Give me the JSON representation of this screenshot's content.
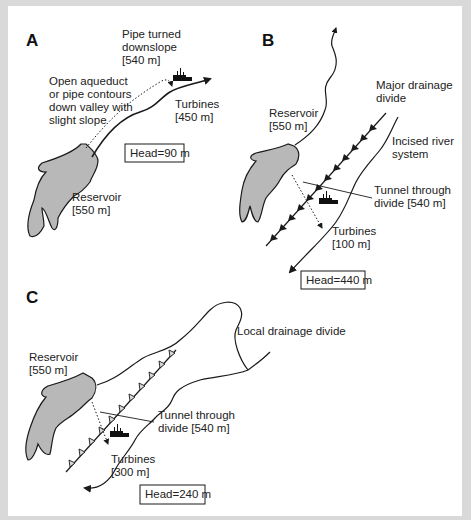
{
  "figure": {
    "panels": [
      {
        "id": "A",
        "label": "A",
        "labels": {
          "pipe_turned_line1": "Pipe turned",
          "pipe_turned_line2": "downslope",
          "pipe_turned_line3": "[540 m]",
          "aqueduct_line1": "Open aqueduct",
          "aqueduct_line2": "or pipe contours",
          "aqueduct_line3": "down valley with",
          "aqueduct_line4": "slight slope",
          "turbines_line1": "Turbines",
          "turbines_line2": "[450 m]",
          "reservoir_line1": "Reservoir",
          "reservoir_line2": "[550 m]"
        },
        "head": "Head=90 m"
      },
      {
        "id": "B",
        "label": "B",
        "labels": {
          "divide_line1": "Major drainage",
          "divide_line2": "divide",
          "reservoir_line1": "Reservoir",
          "reservoir_line2": "[550 m]",
          "river_line1": "Incised river",
          "river_line2": "system",
          "tunnel_line1": "Tunnel through",
          "tunnel_line2": "divide [540 m]",
          "turbines_line1": "Turbines",
          "turbines_line2": "[100 m]"
        },
        "head": "Head=440 m"
      },
      {
        "id": "C",
        "label": "C",
        "labels": {
          "divide": "Local drainage divide",
          "reservoir_line1": "Reservoir",
          "reservoir_line2": "[550 m]",
          "tunnel_line1": "Tunnel through",
          "tunnel_line2": "divide [540 m]",
          "turbines_line1": "Turbines",
          "turbines_line2": "[300 m]"
        },
        "head": "Head=240 m"
      }
    ],
    "colors": {
      "frame": "#d9d9d9",
      "reservoir_fill": "#b8b8b8",
      "line": "#1a1a1a"
    },
    "icons": [
      "turbine-powerhouse-icon",
      "flow-arrow-icon",
      "drainage-divide-barbed-line"
    ]
  }
}
